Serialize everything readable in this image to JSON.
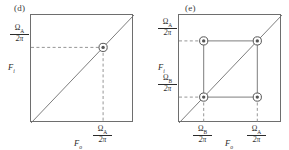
{
  "figure": {
    "background": "#ffffff",
    "line_color": "#6e6e6e",
    "dash_color": "#8a8a8a",
    "marker_color": "#555555",
    "text_color": "#2b2b2b"
  },
  "panels": [
    {
      "id": "d",
      "label": "(d)",
      "axis_x_name": "F",
      "axis_x_sub": "o",
      "axis_y_name": "F",
      "axis_y_sub": "i",
      "y_ticks": [
        {
          "id": "yA",
          "num": "Ω",
          "num_sub": "A",
          "den": "2π",
          "value": 0.7
        }
      ],
      "x_ticks": [
        {
          "id": "xA",
          "num": "Ω",
          "num_sub": "A",
          "den": "2π",
          "value": 0.7
        }
      ],
      "markers": [
        {
          "id": "m-A-A",
          "x": 0.7,
          "y": 0.7,
          "on_diagonal": true
        }
      ],
      "connectors": [],
      "diagonal": true
    },
    {
      "id": "e",
      "label": "(e)",
      "axis_x_name": "F",
      "axis_x_sub": "o",
      "axis_y_name": "F",
      "axis_y_sub": "i",
      "y_ticks": [
        {
          "id": "yA",
          "num": "Ω",
          "num_sub": "A",
          "den": "2π",
          "value": 0.76
        },
        {
          "id": "yB",
          "num": "Ω",
          "num_sub": "B",
          "den": "2π",
          "value": 0.24
        }
      ],
      "x_ticks": [
        {
          "id": "xB",
          "num": "Ω",
          "num_sub": "B",
          "den": "2π",
          "value": 0.24
        },
        {
          "id": "xA",
          "num": "Ω",
          "num_sub": "A",
          "den": "2π",
          "value": 0.76
        }
      ],
      "markers": [
        {
          "id": "m-B-A",
          "x": 0.24,
          "y": 0.76,
          "on_diagonal": false
        },
        {
          "id": "m-A-A",
          "x": 0.76,
          "y": 0.76,
          "on_diagonal": true
        },
        {
          "id": "m-B-B",
          "x": 0.24,
          "y": 0.24,
          "on_diagonal": true
        },
        {
          "id": "m-A-B",
          "x": 0.76,
          "y": 0.24,
          "on_diagonal": false
        }
      ],
      "connectors": [
        {
          "id": "top-edge",
          "x1": 0.24,
          "y1": 0.76,
          "x2": 0.76,
          "y2": 0.76
        },
        {
          "id": "bottom-edge",
          "x1": 0.24,
          "y1": 0.24,
          "x2": 0.76,
          "y2": 0.24
        },
        {
          "id": "left-edge",
          "x1": 0.24,
          "y1": 0.76,
          "x2": 0.24,
          "y2": 0.24
        },
        {
          "id": "right-edge",
          "x1": 0.76,
          "y1": 0.76,
          "x2": 0.76,
          "y2": 0.24
        }
      ],
      "diagonal": true
    }
  ]
}
